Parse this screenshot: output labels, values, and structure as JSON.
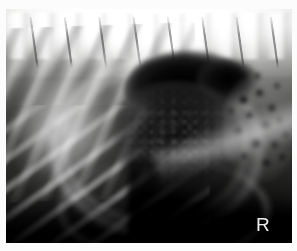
{
  "viewer": {
    "name": "radiograph-viewer",
    "modality": "radiograph",
    "view": "lateral",
    "width": 297,
    "height": 251
  },
  "image": {
    "field_left": 6,
    "field_top": 9,
    "field_width": 286,
    "field_height": 234,
    "border_color": "#fcfcfc",
    "background_color": "#6a6a6a"
  },
  "annotations": {
    "laterality_marker": "R"
  },
  "anatomy": {
    "spine_label": "thoracolumbar-spine",
    "ribs_dorsal_label": "dorsal-ribs",
    "ribs_ventral_label": "ventral-ribs",
    "gas_cap_label": "gas-filled-viscus",
    "central_mass_label": "central-soft-tissue-mass",
    "bowel_label": "bowel-gas-cluster",
    "serosal_label": "serosal-margin",
    "ventral_label": "ventral-body-wall"
  },
  "gas_bubbles": [
    {
      "x": 232,
      "y": 86,
      "w": 11,
      "h": 10
    },
    {
      "x": 249,
      "y": 80,
      "w": 9,
      "h": 8
    },
    {
      "x": 262,
      "y": 95,
      "w": 8,
      "h": 9
    },
    {
      "x": 240,
      "y": 103,
      "w": 7,
      "h": 7
    },
    {
      "x": 255,
      "y": 112,
      "w": 10,
      "h": 9
    },
    {
      "x": 270,
      "y": 108,
      "w": 7,
      "h": 7
    },
    {
      "x": 228,
      "y": 118,
      "w": 9,
      "h": 8
    },
    {
      "x": 244,
      "y": 129,
      "w": 12,
      "h": 11
    },
    {
      "x": 264,
      "y": 131,
      "w": 9,
      "h": 9
    },
    {
      "x": 276,
      "y": 122,
      "w": 7,
      "h": 7
    },
    {
      "x": 234,
      "y": 143,
      "w": 8,
      "h": 8
    },
    {
      "x": 256,
      "y": 150,
      "w": 9,
      "h": 8
    },
    {
      "x": 272,
      "y": 145,
      "w": 8,
      "h": 7
    },
    {
      "x": 222,
      "y": 99,
      "w": 6,
      "h": 6
    },
    {
      "x": 248,
      "y": 64,
      "w": 7,
      "h": 6
    },
    {
      "x": 268,
      "y": 74,
      "w": 6,
      "h": 6
    }
  ]
}
